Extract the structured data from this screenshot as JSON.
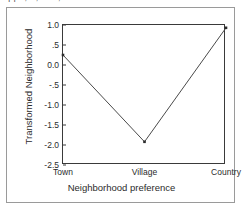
{
  "figure": {
    "caption_remnant": "||  ,  ,  .  ,",
    "border_color": "#9a9a9a",
    "background": "#ffffff"
  },
  "chart_data": {
    "type": "line",
    "title": "",
    "subtitle": "",
    "xlabel": "Neighborhood preference",
    "ylabel": "Transformed Neighborhood",
    "categories": [
      "Town",
      "Village",
      "Country"
    ],
    "values": [
      0.25,
      -1.92,
      0.93
    ],
    "series": [
      {
        "name": "Transformed Neighborhood",
        "values": [
          0.25,
          -1.92,
          0.93
        ]
      }
    ],
    "ylim": [
      -2.5,
      1.0
    ],
    "yticks": [
      1.0,
      0.5,
      0.0,
      -0.5,
      -1.0,
      -1.5,
      -2.0,
      -2.5
    ],
    "ytick_labels": [
      "1.0",
      ".5",
      "0.0",
      "-.5",
      "-1.0",
      "-1.5",
      "-2.0",
      "-2.5"
    ],
    "xtick_labels": [
      "Town",
      "Village",
      "Country"
    ],
    "grid": false,
    "legend": false,
    "legend_position": "none",
    "line_color": "#4a4a4a",
    "marker": "square",
    "marker_color": "#2b2b2b",
    "axis_color": "#3a3a3a"
  }
}
